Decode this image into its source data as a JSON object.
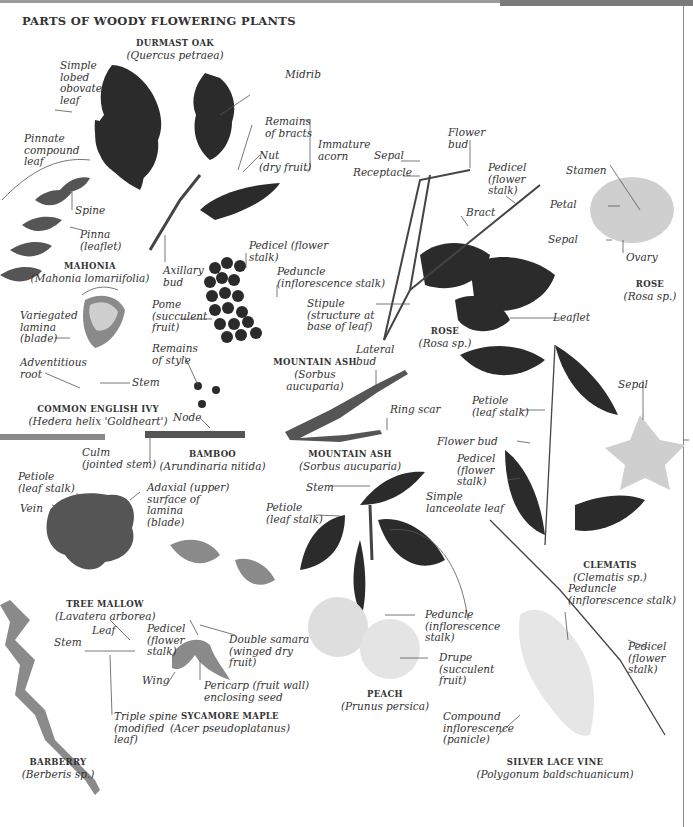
{
  "page": {
    "title": "PARTS OF WOODY FLOWERING PLANTS"
  },
  "specimens": {
    "durmast_oak": {
      "name": "DURMAST OAK",
      "scientific": "(Quercus petraea)"
    },
    "mahonia": {
      "name": "MAHONIA",
      "scientific": "(Mahonia lomariifolia)"
    },
    "rose_branch": {
      "name": "ROSE",
      "scientific": "(Rosa sp.)"
    },
    "rose_flower": {
      "name": "ROSE",
      "scientific": "(Rosa sp.)"
    },
    "common_english_ivy": {
      "name": "COMMON ENGLISH IVY",
      "scientific": "(Hedera helix 'Goldheart')"
    },
    "mountain_ash_fruit": {
      "name": "MOUNTAIN ASH",
      "scientific": "(Sorbus\naucuparia)"
    },
    "mountain_ash_twig": {
      "name": "MOUNTAIN ASH",
      "scientific": "(Sorbus aucuparia)"
    },
    "bamboo": {
      "name": "BAMBOO",
      "scientific": "(Arundinaria nitida)"
    },
    "tree_mallow": {
      "name": "TREE MALLOW",
      "scientific": "(Lavatera arborea)"
    },
    "sycamore_maple": {
      "name": "SYCAMORE MAPLE",
      "scientific": "(Acer pseudoplatanus)"
    },
    "peach": {
      "name": "PEACH",
      "scientific": "(Prunus persica)"
    },
    "clematis": {
      "name": "CLEMATIS",
      "scientific": "(Clematis sp.)"
    },
    "barberry": {
      "name": "BARBERRY",
      "scientific": "(Berberis sp.)"
    },
    "silver_lace_vine": {
      "name": "SILVER LACE VINE",
      "scientific": "(Polygonum baldschuanicum)"
    }
  },
  "labels": {
    "oak_simple_lobed": "Simple\nlobed\nobovate\nleaf",
    "oak_midrib": "Midrib",
    "oak_remains_bracts": "Remains\nof bracts",
    "oak_nut": "Nut\n(dry fruit)",
    "oak_immature_acorn": "Immature\nacorn",
    "oak_axillary_bud": "Axillary\nbud",
    "mahonia_pinnate": "Pinnate\ncompound\nleaf",
    "mahonia_spine": "Spine",
    "mahonia_pinna": "Pinna\n(leaflet)",
    "rose_sepal": "Sepal",
    "rose_receptacle": "Receptacle",
    "rose_flower_bud": "Flower\nbud",
    "rose_pedicel": "Pedicel\n(flower\nstalk)",
    "rose_bract": "Bract",
    "rose_stipule": "Stipule\n(structure at\nbase of leaf)",
    "rose_leaflet": "Leaflet",
    "roseflower_stamen": "Stamen",
    "roseflower_petal": "Petal",
    "roseflower_sepal": "Sepal",
    "roseflower_ovary": "Ovary",
    "ash_pedicel": "Pedicel (flower\nstalk)",
    "ash_peduncle": "Peduncle\n(inflorescence stalk)",
    "ash_pome": "Pome\n(succulent\nfruit)",
    "ash_remains_style": "Remains\nof style",
    "ivy_variegated": "Variegated\nlamina\n(blade)",
    "ivy_adventitious": "Adventitious\nroot",
    "ivy_stem": "Stem",
    "bamboo_node": "Node",
    "bamboo_culm": "Culm\n(jointed stem)",
    "ashtwig_lateral_bud": "Lateral\nbud",
    "ashtwig_ring_scar": "Ring scar",
    "clematis_petiole": "Petiole\n(leaf stalk)",
    "clematis_sepal": "Sepal",
    "clematis_flower_bud": "Flower bud",
    "clematis_pedicel": "Pedicel\n(flower\nstalk)",
    "mallow_petiole": "Petiole\n(leaf stalk)",
    "mallow_vein": "Vein",
    "mallow_adaxial": "Adaxial (upper)\nsurface of\nlamina\n(blade)",
    "peach_stem": "Stem",
    "peach_petiole": "Petiole\n(leaf stalk)",
    "peach_simple_lanceolate": "Simple\nlanceolate leaf",
    "peach_peduncle": "Peduncle\n(inflorescence\nstalk)",
    "peach_drupe": "Drupe\n(succulent\nfruit)",
    "maple_pedicel": "Pedicel\n(flower\nstalk)",
    "maple_double_samara": "Double samara\n(winged dry\nfruit)",
    "maple_wing": "Wing",
    "maple_pericarp": "Pericarp (fruit wall)\nenclosing seed",
    "barberry_stem": "Stem",
    "barberry_leaf": "Leaf",
    "barberry_triple_spine": "Triple spine\n(modified\nleaf)",
    "lace_peduncle": "Peduncle\n(inflorescence stalk)",
    "lace_pedicel": "Pedicel\n(flower\nstalk)",
    "lace_compound": "Compound\ninflorescence\n(panicle)"
  },
  "colors": {
    "dark_leaf": "#2b2b2b",
    "mid_leaf": "#555555",
    "light_leaf": "#8a8a8a",
    "pale": "#cfcfcf",
    "leader_line": "#555555",
    "rule": "#8a8a8a"
  }
}
